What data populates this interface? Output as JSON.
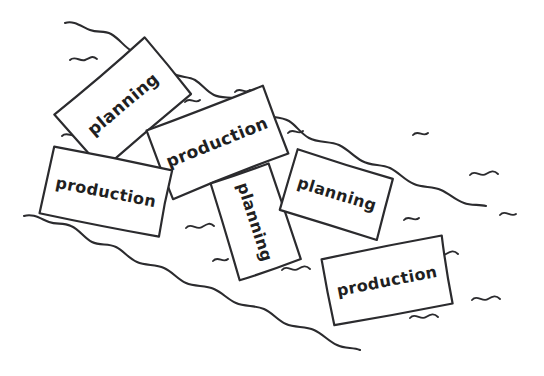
{
  "scene": {
    "title": "hand-drawn sketch of labelled cards floating on a stream",
    "background_color": "#ffffff",
    "ink_color": "#2b2b2e",
    "width": 544,
    "height": 376
  },
  "cards": [
    {
      "id": "card-1",
      "label": "planning",
      "center_x": 123,
      "center_y": 104,
      "width": 118,
      "height": 72,
      "rotation": -40,
      "font_size": 17
    },
    {
      "id": "card-2",
      "label": "production",
      "center_x": 217,
      "center_y": 142,
      "width": 124,
      "height": 72,
      "rotation": -22,
      "font_size": 17
    },
    {
      "id": "card-3",
      "label": "production",
      "center_x": 106,
      "center_y": 192,
      "width": 120,
      "height": 68,
      "rotation": 11,
      "font_size": 16
    },
    {
      "id": "card-4",
      "label": "planning",
      "center_x": 255,
      "center_y": 222,
      "width": 102,
      "height": 62,
      "rotation": 72,
      "font_size": 16
    },
    {
      "id": "card-5",
      "label": "planning",
      "center_x": 337,
      "center_y": 194,
      "width": 100,
      "height": 62,
      "rotation": 17,
      "font_size": 16
    },
    {
      "id": "card-6",
      "label": "production",
      "center_x": 387,
      "center_y": 281,
      "width": 122,
      "height": 68,
      "rotation": -11,
      "font_size": 16
    }
  ],
  "banks": {
    "upper_bank_label": "upper stream bank",
    "lower_bank_label": "lower stream bank"
  },
  "ripple_count": 14
}
